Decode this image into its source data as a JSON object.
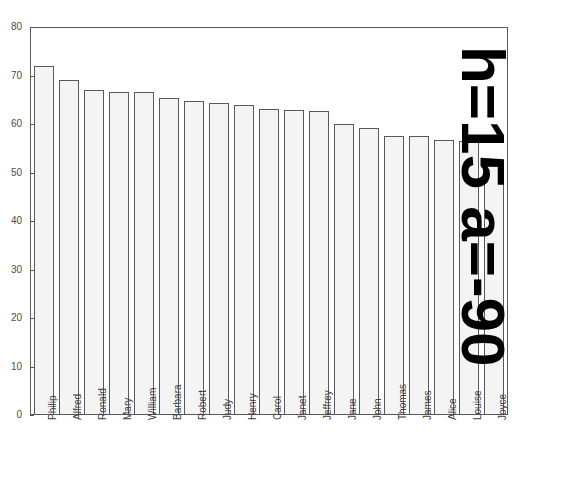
{
  "chart_data": {
    "type": "bar",
    "title": "",
    "subtitle": "",
    "xlabel": "",
    "ylabel": "",
    "ylim": [
      0,
      80
    ],
    "yticks": [
      0,
      10,
      20,
      30,
      40,
      50,
      60,
      70,
      80
    ],
    "ytick_labels": [
      "0",
      "10",
      "20",
      "30",
      "40",
      "50",
      "60",
      "70",
      "80"
    ],
    "grid": false,
    "legend": null,
    "legend_position": "none",
    "categories": [
      "Philip",
      "Alfred",
      "Ronald",
      "Mary",
      "William",
      "Barbara",
      "Robert",
      "Judy",
      "Henry",
      "Carol",
      "Janet",
      "Jeffrey",
      "Jane",
      "John",
      "Thomas",
      "James",
      "Alice",
      "Louise",
      "Joyce"
    ],
    "values": [
      72.0,
      69.0,
      67.0,
      66.5,
      66.5,
      65.3,
      64.8,
      64.4,
      63.9,
      63.0,
      62.8,
      62.7,
      60.0,
      59.2,
      57.6,
      57.5,
      56.8,
      56.5,
      51.4
    ],
    "annotations": [
      {
        "text": "h=15 a=-90",
        "rotation": -90,
        "position": "right-outside"
      }
    ]
  },
  "annotation": {
    "text": "h=15 a=-90"
  },
  "colors": {
    "bar_fill": "#f4f4f4",
    "bar_edge": "#595959",
    "axis": "#5a5a5a",
    "tick_label": "#4c4c4c",
    "category_label": "#3d3d3d",
    "annotation": "#000000",
    "background": "#ffffff"
  }
}
